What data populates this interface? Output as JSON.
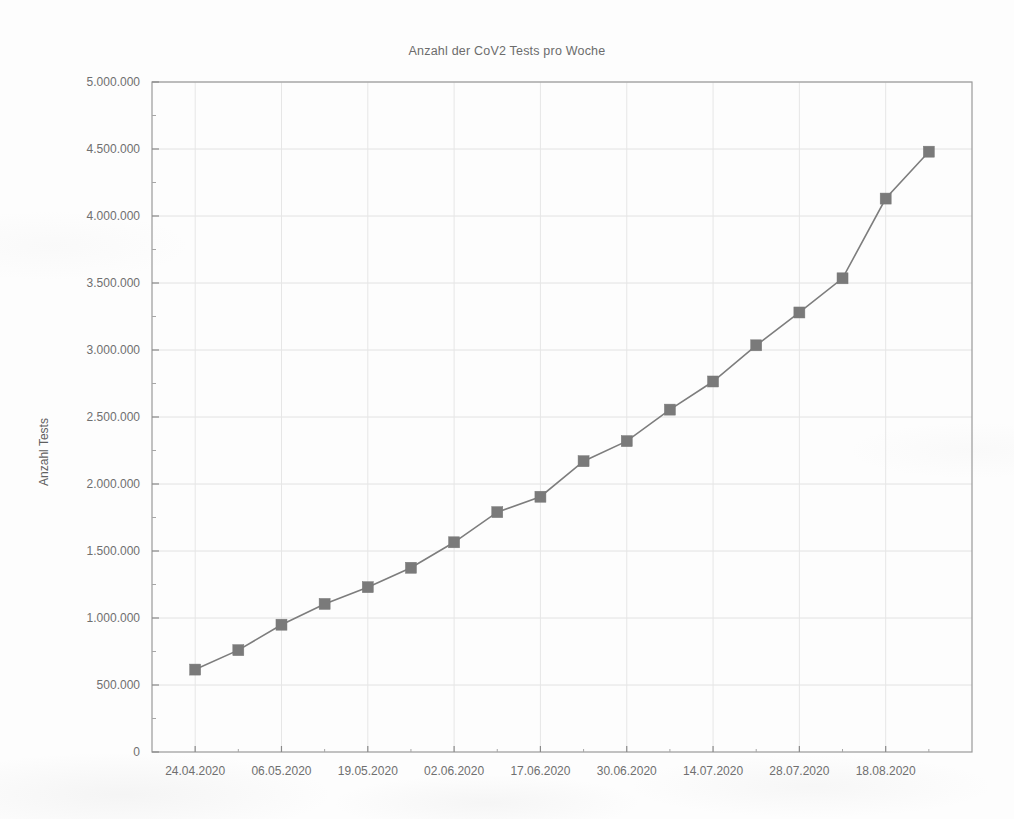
{
  "chart_data": {
    "type": "line",
    "title": "Anzahl der CoV2 Tests pro Woche",
    "xlabel": "",
    "ylabel": "Anzahl Tests",
    "ylim": [
      0,
      5000000
    ],
    "ytick_step": 500000,
    "ytick_labels": [
      "0",
      "500.000",
      "1.000.000",
      "1.500.000",
      "2.000.000",
      "2.500.000",
      "3.000.000",
      "3.500.000",
      "4.000.000",
      "4.500.000",
      "5.000.000"
    ],
    "ytick_values": [
      0,
      500000,
      1000000,
      1500000,
      2000000,
      2500000,
      3000000,
      3500000,
      4000000,
      4500000,
      5000000
    ],
    "xtick_labels": [
      "24.04.2020",
      "06.05.2020",
      "19.05.2020",
      "02.06.2020",
      "17.06.2020",
      "30.06.2020",
      "14.07.2020",
      "28.07.2020",
      "18.08.2020"
    ],
    "grid": true,
    "legend": "none",
    "marker": "square",
    "line_color": "#7d7d7d",
    "marker_color": "#7a7a7a",
    "categories": [
      "24.04.2020",
      "30.04.2020",
      "06.05.2020",
      "12.05.2020",
      "19.05.2020",
      "26.05.2020",
      "02.06.2020",
      "09.06.2020",
      "17.06.2020",
      "23.06.2020",
      "30.06.2020",
      "07.07.2020",
      "14.07.2020",
      "21.07.2020",
      "28.07.2020",
      "05.08.2020",
      "18.08.2020",
      "25.08.2020"
    ],
    "values": [
      615000,
      760000,
      950000,
      1105000,
      1230000,
      1375000,
      1565000,
      1790000,
      1905000,
      2170000,
      2320000,
      2555000,
      2765000,
      3035000,
      3280000,
      3535000,
      4130000,
      4480000
    ]
  },
  "axes": {
    "y_axis_title": "Anzahl Tests"
  }
}
